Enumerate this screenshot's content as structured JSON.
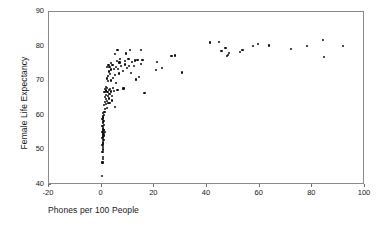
{
  "chart_data": {
    "type": "scatter",
    "title": "",
    "xlabel": "Phones per 100 People",
    "ylabel": "Female Life Expectancy",
    "xlim": [
      -20,
      100
    ],
    "ylim": [
      40,
      90
    ],
    "xticks": [
      -20,
      0,
      20,
      40,
      60,
      80,
      100
    ],
    "yticks": [
      40,
      50,
      60,
      70,
      80,
      90
    ],
    "grid": false,
    "legend": null,
    "marker": "filled-circle",
    "marker_color": "#101010",
    "frame_color": "#8a8a8a",
    "background": "#ffffff",
    "points": [
      [
        0.2,
        42.5
      ],
      [
        0.3,
        46.5
      ],
      [
        0.4,
        47.5
      ],
      [
        0.5,
        48.0
      ],
      [
        0.3,
        49.5
      ],
      [
        0.6,
        50.0
      ],
      [
        0.4,
        50.5
      ],
      [
        0.5,
        51.0
      ],
      [
        0.3,
        51.5
      ],
      [
        0.6,
        52.0
      ],
      [
        0.4,
        52.5
      ],
      [
        0.7,
        53.0
      ],
      [
        0.3,
        53.5
      ],
      [
        0.5,
        54.0
      ],
      [
        0.8,
        54.3
      ],
      [
        0.4,
        54.6
      ],
      [
        0.6,
        55.0
      ],
      [
        0.9,
        55.0
      ],
      [
        1.2,
        55.2
      ],
      [
        0.3,
        55.4
      ],
      [
        0.5,
        55.6
      ],
      [
        0.7,
        55.8
      ],
      [
        1.0,
        55.9
      ],
      [
        0.4,
        56.2
      ],
      [
        0.6,
        56.5
      ],
      [
        0.3,
        57.0
      ],
      [
        0.8,
        57.3
      ],
      [
        0.5,
        57.8
      ],
      [
        0.4,
        58.2
      ],
      [
        0.7,
        58.6
      ],
      [
        0.3,
        59.0
      ],
      [
        0.6,
        59.5
      ],
      [
        0.5,
        60.0
      ],
      [
        0.9,
        60.3
      ],
      [
        0.4,
        60.8
      ],
      [
        1.1,
        61.2
      ],
      [
        1.4,
        62.0
      ],
      [
        2.0,
        62.3
      ],
      [
        5.2,
        62.6
      ],
      [
        1.0,
        63.2
      ],
      [
        1.8,
        63.5
      ],
      [
        2.6,
        63.6
      ],
      [
        3.2,
        63.7
      ],
      [
        1.3,
        64.0
      ],
      [
        2.1,
        64.2
      ],
      [
        3.8,
        64.4
      ],
      [
        1.6,
        64.8
      ],
      [
        2.9,
        65.0
      ],
      [
        1.2,
        65.5
      ],
      [
        2.4,
        65.7
      ],
      [
        4.0,
        65.8
      ],
      [
        1.5,
        66.0
      ],
      [
        3.0,
        66.2
      ],
      [
        16.3,
        66.5
      ],
      [
        1.1,
        66.8
      ],
      [
        2.2,
        66.9
      ],
      [
        3.5,
        67.0
      ],
      [
        4.8,
        67.1
      ],
      [
        1.8,
        67.3
      ],
      [
        2.8,
        67.4
      ],
      [
        6.0,
        67.5
      ],
      [
        1.4,
        67.7
      ],
      [
        3.3,
        67.8
      ],
      [
        8.3,
        67.9
      ],
      [
        2.0,
        68.0
      ],
      [
        4.4,
        68.1
      ],
      [
        1.6,
        68.3
      ],
      [
        5.5,
        69.5
      ],
      [
        2.5,
        70.0
      ],
      [
        3.7,
        70.2
      ],
      [
        13.0,
        70.5
      ],
      [
        1.9,
        70.8
      ],
      [
        4.2,
        71.0
      ],
      [
        14.2,
        71.2
      ],
      [
        2.3,
        71.5
      ],
      [
        5.0,
        71.8
      ],
      [
        3.1,
        72.0
      ],
      [
        6.6,
        72.2
      ],
      [
        11.0,
        72.4
      ],
      [
        30.5,
        72.5
      ],
      [
        2.7,
        72.8
      ],
      [
        8.0,
        73.0
      ],
      [
        20.5,
        73.2
      ],
      [
        3.4,
        73.4
      ],
      [
        4.6,
        73.5
      ],
      [
        6.2,
        73.6
      ],
      [
        9.5,
        73.7
      ],
      [
        23.0,
        73.8
      ],
      [
        2.1,
        74.0
      ],
      [
        3.0,
        74.1
      ],
      [
        5.3,
        74.2
      ],
      [
        7.4,
        74.3
      ],
      [
        10.5,
        74.4
      ],
      [
        12.2,
        74.5
      ],
      [
        2.6,
        74.6
      ],
      [
        4.1,
        74.7
      ],
      [
        8.8,
        74.8
      ],
      [
        14.8,
        74.9
      ],
      [
        3.6,
        75.2
      ],
      [
        6.8,
        75.4
      ],
      [
        11.6,
        75.5
      ],
      [
        21.0,
        75.6
      ],
      [
        5.8,
        75.8
      ],
      [
        9.0,
        75.9
      ],
      [
        12.8,
        76.0
      ],
      [
        15.5,
        76.1
      ],
      [
        13.6,
        76.2
      ],
      [
        10.2,
        76.3
      ],
      [
        7.0,
        76.5
      ],
      [
        26.5,
        77.3
      ],
      [
        28.0,
        77.4
      ],
      [
        47.5,
        77.3
      ],
      [
        84.5,
        77.0
      ],
      [
        48.0,
        77.6
      ],
      [
        5.2,
        77.8
      ],
      [
        48.5,
        78.2
      ],
      [
        52.5,
        78.4
      ],
      [
        9.2,
        78.0
      ],
      [
        45.5,
        78.8
      ],
      [
        53.5,
        78.9
      ],
      [
        15.0,
        78.9
      ],
      [
        6.0,
        79.1
      ],
      [
        72.0,
        79.3
      ],
      [
        47.0,
        79.5
      ],
      [
        10.8,
        79.0
      ],
      [
        78.0,
        80.1
      ],
      [
        57.5,
        80.2
      ],
      [
        63.5,
        80.3
      ],
      [
        91.5,
        80.2
      ],
      [
        59.5,
        80.8
      ],
      [
        41.0,
        81.2
      ],
      [
        44.5,
        81.4
      ],
      [
        84.0,
        82.0
      ]
    ]
  }
}
